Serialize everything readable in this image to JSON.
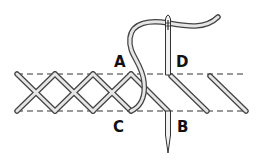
{
  "diagram": {
    "type": "stitch-illustration",
    "labels": {
      "a": "A",
      "b": "B",
      "c": "C",
      "d": "D"
    },
    "colors": {
      "outline": "#333333",
      "fill": "#e6e6e6",
      "guide_line": "#333333",
      "background": "#ffffff"
    }
  }
}
